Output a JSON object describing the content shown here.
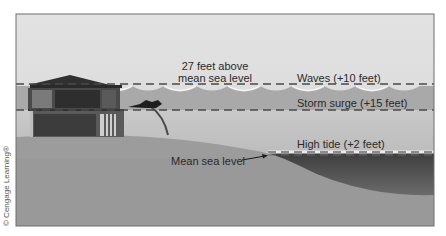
{
  "figure": {
    "type": "storm-surge-diagram",
    "labels": {
      "total_height_line1": "27 feet above",
      "total_height_line2": "mean sea level",
      "waves": "Waves (+10 feet)",
      "storm_surge": "Storm surge (+15 feet)",
      "high_tide": "High tide (+2 feet)",
      "mean_sea_level": "Mean sea level"
    },
    "credit": "© Cengage Learning®",
    "levels_feet": {
      "high_tide": 2,
      "storm_surge": 15,
      "waves": 10,
      "total_above_mean_sea_level": 27
    },
    "colors": {
      "sky": "#dedede",
      "surge_water": "#a9a9a9",
      "lower_water": "#c6c6c6",
      "land": "#9c9c9c",
      "sea": "#585858",
      "house": "#3a3a3a",
      "frame": "#6e6e6e"
    }
  }
}
